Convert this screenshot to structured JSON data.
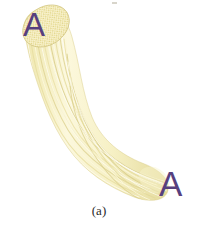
{
  "figure": {
    "caption": "(a)",
    "background_color": "#ffffff",
    "width": 198,
    "height": 233,
    "labels": [
      {
        "id": "top",
        "text": "A",
        "color": "#57407e",
        "position": "upper-left cross-section end"
      },
      {
        "id": "bottom",
        "text": "A",
        "color": "#57407e",
        "position": "lower-right tapered end"
      }
    ],
    "bundle": {
      "fiber_color_light": "#fbf6d2",
      "fiber_color_mid": "#f2ecbb",
      "fiber_color_dark": "#ddd498",
      "fiber_edge_color": "#cfc47f",
      "cross_section_dot_color": "#e3d88c",
      "cross_section_fill": "#f7f1c8",
      "fiber_count": 26,
      "shape": "s-curve from upper-left to lower-right"
    },
    "artifact": {
      "present": true,
      "description": "faint scan speck near top edge"
    }
  }
}
